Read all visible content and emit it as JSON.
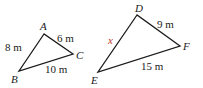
{
  "figure": {
    "accent_color": "#c0392b",
    "line_color": "#1a1a1a",
    "triangles": [
      {
        "name": "triangle-abc",
        "vertices": [
          {
            "label": "A",
            "x": 44,
            "y": 34,
            "lx": 40,
            "ly": 30
          },
          {
            "label": "B",
            "x": 19,
            "y": 71,
            "lx": 11,
            "ly": 83
          },
          {
            "label": "C",
            "x": 73,
            "y": 54,
            "lx": 76,
            "ly": 59
          }
        ],
        "sides": [
          {
            "name": "AB",
            "label": "8 m",
            "lx": 5,
            "ly": 51
          },
          {
            "name": "AC",
            "label": "6 m",
            "lx": 57,
            "ly": 42
          },
          {
            "name": "BC",
            "label": "10 m",
            "lx": 45,
            "ly": 73
          }
        ]
      },
      {
        "name": "triangle-def",
        "vertices": [
          {
            "label": "D",
            "x": 137,
            "y": 15,
            "lx": 135,
            "ly": 12
          },
          {
            "label": "E",
            "x": 98,
            "y": 72,
            "lx": 91,
            "ly": 84
          },
          {
            "label": "F",
            "x": 180,
            "y": 46,
            "lx": 183,
            "ly": 50
          }
        ],
        "sides": [
          {
            "name": "DE",
            "label": "x",
            "lx": 108,
            "ly": 44,
            "unknown": true
          },
          {
            "name": "DF",
            "label": "9 m",
            "lx": 157,
            "ly": 28
          },
          {
            "name": "EF",
            "label": "15 m",
            "lx": 141,
            "ly": 70
          }
        ]
      }
    ]
  }
}
